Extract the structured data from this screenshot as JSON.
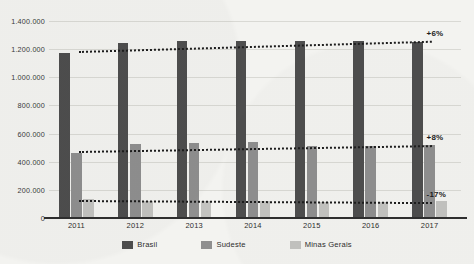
{
  "chart_data": {
    "type": "bar",
    "title": "",
    "subtitle": "",
    "xlabel": "",
    "ylabel": "",
    "categories": [
      "2011",
      "2012",
      "2013",
      "2014",
      "2015",
      "2016",
      "2017"
    ],
    "series": [
      {
        "name": "Brasil",
        "color": "#4e4e4e",
        "values": [
          1175000,
          1245000,
          1255000,
          1258000,
          1255000,
          1258000,
          1250000
        ]
      },
      {
        "name": "Sudeste",
        "color": "#8f8f8f",
        "values": [
          465000,
          525000,
          535000,
          540000,
          515000,
          512000,
          518000
        ]
      },
      {
        "name": "Minas Gerais",
        "color": "#c3c3c0",
        "values": [
          132000,
          122000,
          120000,
          118000,
          117000,
          115000,
          118000
        ]
      }
    ],
    "ylim": [
      0,
      1400000
    ],
    "yticks": [
      "0",
      "200.000",
      "400.000",
      "600.000",
      "800.000",
      "1.000.000",
      "1.200.000",
      "1.400.000"
    ],
    "ytick_values": [
      0,
      200000,
      400000,
      600000,
      800000,
      1000000,
      1200000,
      1400000
    ],
    "grid": true,
    "legend_position": "bottom",
    "trendlines": [
      {
        "series": "Brasil",
        "start_value": 1185000,
        "end_value": 1258000,
        "annotation": "+6%"
      },
      {
        "series": "Sudeste",
        "start_value": 478000,
        "end_value": 520000,
        "annotation": "+8%"
      },
      {
        "series": "Minas Gerais",
        "start_value": 128000,
        "end_value": 113000,
        "annotation": "-17%"
      }
    ],
    "annotations": [
      "+6%",
      "+8%",
      "-17%"
    ]
  },
  "legend": {
    "items": [
      {
        "label": "Brasil",
        "color": "#4e4e4e"
      },
      {
        "label": "Sudeste",
        "color": "#8f8f8f"
      },
      {
        "label": "Minas Gerais",
        "color": "#c3c3c0"
      }
    ]
  }
}
